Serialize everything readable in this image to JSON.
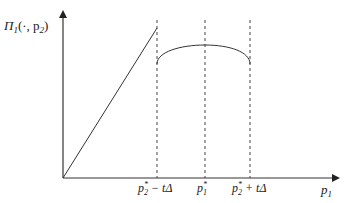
{
  "diagram": {
    "y_axis_label": {
      "main": "Π",
      "sub": "1",
      "args": "(·, p",
      "args_sub": "2",
      "close": ")"
    },
    "x_axis_label": {
      "main": "p",
      "sub": "1"
    },
    "ticks": [
      {
        "id": "left",
        "main": "p",
        "sup": "*",
        "sub": "2",
        "suffix": " − tΔ"
      },
      {
        "id": "mid",
        "main": "p",
        "sup": "*",
        "sub": "1",
        "suffix": ""
      },
      {
        "id": "right",
        "main": "p",
        "sup": "*",
        "sub": "2",
        "suffix": " + tΔ"
      }
    ]
  },
  "colors": {
    "line": "#333333",
    "background": "#ffffff"
  }
}
